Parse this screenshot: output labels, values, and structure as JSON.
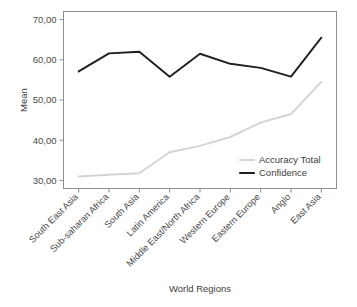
{
  "chart_data": {
    "type": "line",
    "title": "",
    "xlabel": "World Regions",
    "ylabel": "Mean",
    "categories": [
      "South East Asia",
      "Sub-saharan Africa",
      "South Asia",
      "Latin America",
      "Middle East/North Africa",
      "Western Europe",
      "Eastern Europe",
      "Anglo",
      "East Asia"
    ],
    "series": [
      {
        "name": "Accuracy Total",
        "color": "#d4d4d4",
        "values": [
          31.0,
          31.4,
          31.8,
          37.0,
          38.6,
          40.8,
          44.4,
          46.5,
          54.5
        ]
      },
      {
        "name": "Confidence",
        "color": "#1f1f1f",
        "values": [
          57.1,
          61.6,
          62.0,
          55.8,
          61.5,
          59.0,
          58.0,
          55.8,
          65.5
        ]
      }
    ],
    "ylim": [
      28.0,
      72.0
    ],
    "yticks": [
      "30,00",
      "40,00",
      "50,00",
      "60,00",
      "70,00"
    ],
    "ytick_values": [
      30,
      40,
      50,
      60,
      70
    ],
    "grid": false,
    "legend_position": "inside-bottom-right"
  },
  "legend": {
    "items": [
      {
        "label": "Accuracy Total",
        "color": "#d4d4d4"
      },
      {
        "label": "Confidence",
        "color": "#1f1f1f"
      }
    ]
  },
  "axes": {
    "y_title": "Mean",
    "x_title": "World Regions"
  }
}
